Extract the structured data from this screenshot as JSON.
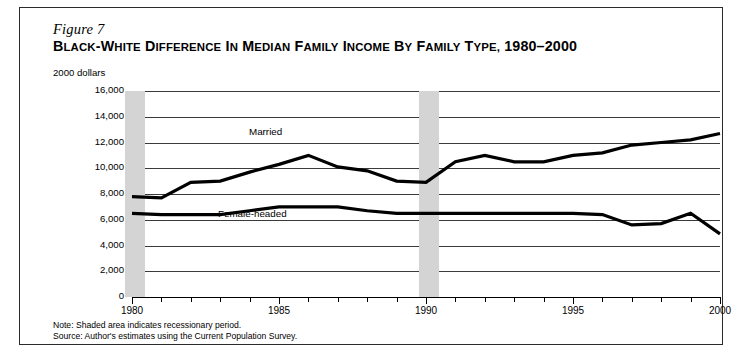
{
  "figure": {
    "number": "Figure 7",
    "title_main": "B",
    "note": "Note: Shaded area indicates recessionary period.",
    "source": "Source: Author's estimates using the Current Population Survey."
  },
  "colors": {
    "frame": "#2b2b2b",
    "gridline": "#3a3a3a",
    "series": "#000000",
    "recession_band": "#d4d4d4",
    "background": "#ffffff"
  },
  "chart_data": {
    "type": "line",
    "subtitle": "Figure 7",
    "xlabel": "",
    "ylabel": "2000 dollars",
    "xlim": [
      1980,
      2000
    ],
    "ylim": [
      0,
      16000
    ],
    "grid": true,
    "legend_position": "inline-annotations",
    "x": [
      1980,
      1981,
      1982,
      1983,
      1984,
      1985,
      1986,
      1987,
      1988,
      1989,
      1990,
      1991,
      1992,
      1993,
      1994,
      1995,
      1996,
      1997,
      1998,
      1999,
      2000
    ],
    "xticks": [
      1980,
      1985,
      1990,
      1995,
      2000
    ],
    "xtick_labels": [
      "1980",
      "1985",
      "1990",
      "1995",
      "2000"
    ],
    "yticks": [
      0,
      2000,
      4000,
      6000,
      8000,
      10000,
      12000,
      14000,
      16000
    ],
    "ytick_labels": [
      "0",
      "2,000",
      "4,000",
      "6,000",
      "8,000",
      "10,000",
      "12,000",
      "14,000",
      "16,000"
    ],
    "series": [
      {
        "name": "Married",
        "label": "Married",
        "values": [
          7800,
          7700,
          8900,
          9000,
          9700,
          10300,
          11000,
          10100,
          9800,
          9000,
          8900,
          10500,
          11000,
          10500,
          10500,
          11000,
          11200,
          11800,
          12000,
          12200,
          12700
        ]
      },
      {
        "name": "Female-headed",
        "label": "Female-headed",
        "values": [
          6500,
          6400,
          6400,
          6400,
          6700,
          7000,
          7000,
          7000,
          6700,
          6500,
          6500,
          6500,
          6500,
          6500,
          6500,
          6500,
          6400,
          5600,
          5700,
          6500,
          4900
        ]
      }
    ],
    "annotations": [
      {
        "text": "Married",
        "x": 1985.9,
        "y": 12600
      },
      {
        "text": "Female-headed",
        "x": 1984.9,
        "y": 6050
      }
    ],
    "shaded_regions": [
      {
        "label": "recessionary period",
        "x_start": 1979.75,
        "x_end": 1980.45
      },
      {
        "label": "recessionary period",
        "x_start": 1989.75,
        "x_end": 1990.45
      }
    ]
  }
}
